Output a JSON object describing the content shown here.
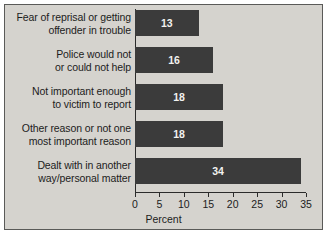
{
  "chart_data": {
    "type": "bar",
    "orientation": "horizontal",
    "title": "",
    "xlabel": "Percent",
    "ylabel": "",
    "categories": [
      "Fear of reprisal or getting\noffender in trouble",
      "Police would not\nor could not help",
      "Not important enough\nto victim to report",
      "Other reason or not one\nmost important reason",
      "Dealt with in another\nway/personal matter"
    ],
    "values": [
      13,
      16,
      18,
      18,
      34
    ],
    "value_labels": [
      "13",
      "16",
      "18",
      "18",
      "34"
    ],
    "xlim": [
      0,
      35
    ],
    "xticks": [
      0,
      5,
      10,
      15,
      20,
      25,
      30,
      35
    ],
    "xtick_labels": [
      "0",
      "5",
      "10",
      "15",
      "20",
      "25",
      "30",
      "35"
    ],
    "grid": false,
    "legend": null,
    "colors": {
      "bar": "#3b3b3b",
      "bar_value_text": "#f2f2f0",
      "background": "#d5d3ce",
      "axis": "#2b2b2b",
      "text": "#1c1c1c",
      "frame_border": "#5a5a58"
    }
  }
}
